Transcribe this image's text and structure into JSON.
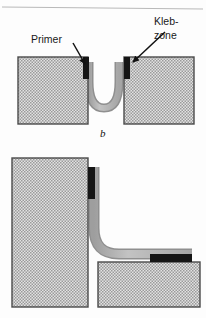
{
  "figure": {
    "caption": "b",
    "background_color": "#fdfdfd",
    "top_rule_color": "#b9b9b9"
  },
  "labels": {
    "primer": "Primer",
    "klebzone_line1": "Kleb-",
    "klebzone_line2": "zone"
  },
  "colors": {
    "substrate_fill": "#d8d8d8",
    "substrate_border": "#4a4a4a",
    "hatch_dot": "#9a9a9a",
    "adhesive_fill": "#b5b5b5",
    "adhesive_edge": "#8f8f8f",
    "primer_black": "#151515",
    "leader_line": "#111111",
    "text": "#1a1a1a"
  },
  "upper_view": {
    "name": "u-bend-joint",
    "left_block": {
      "x": 18,
      "y": 57,
      "w": 70,
      "h": 67
    },
    "right_block": {
      "x": 124,
      "y": 57,
      "w": 70,
      "h": 67
    },
    "left_primer": {
      "x": 83,
      "y": 57,
      "w": 6,
      "h": 22
    },
    "right_primer": {
      "x": 124,
      "y": 57,
      "w": 6,
      "h": 22
    },
    "adhesive_path": "U-shaped bead between blocks"
  },
  "lower_view": {
    "name": "l-bend-joint",
    "tall_block": {
      "x": 12,
      "y": 158,
      "w": 76,
      "h": 149
    },
    "low_block": {
      "x": 98,
      "y": 262,
      "w": 102,
      "h": 45
    },
    "vertical_primer": {
      "x": 88,
      "y": 167,
      "w": 7,
      "h": 32
    },
    "horizontal_primer": {
      "x": 150,
      "y": 254,
      "w": 42,
      "h": 8
    },
    "adhesive_path": "L-shaped bead from vertical face to horizontal face"
  },
  "annotations": [
    {
      "id": "primer-arrow",
      "from_x": 74,
      "from_y": 41,
      "to_x": 86,
      "to_y": 66
    },
    {
      "id": "klebzone-arrow",
      "from_x": 164,
      "from_y": 33,
      "to_x": 131,
      "to_y": 64
    }
  ]
}
